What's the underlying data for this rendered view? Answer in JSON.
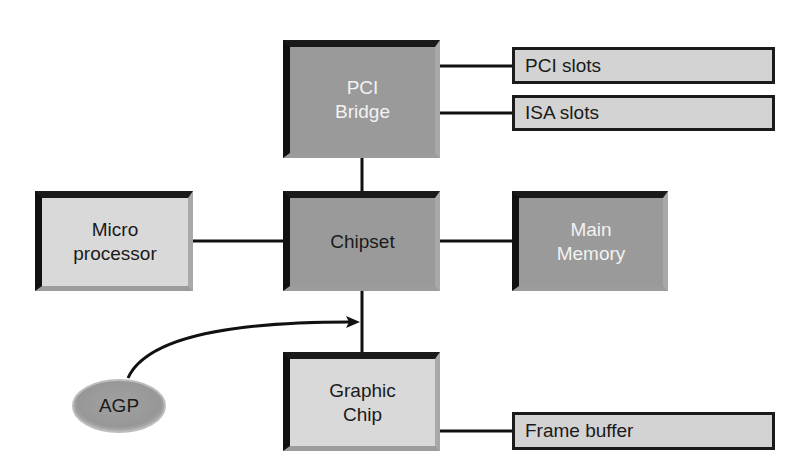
{
  "diagram": {
    "type": "block-diagram",
    "nodes": [
      {
        "id": "pci_bridge",
        "label_lines": [
          "PCI",
          "Bridge"
        ],
        "shape": "bevel-box",
        "fill": "#9a9a9a"
      },
      {
        "id": "pci_slots",
        "label": "PCI slots",
        "shape": "flat-box",
        "fill": "#d3d3d3"
      },
      {
        "id": "isa_slots",
        "label": "ISA slots",
        "shape": "flat-box",
        "fill": "#d3d3d3"
      },
      {
        "id": "micro_processor",
        "label_lines": [
          "Micro",
          "processor"
        ],
        "shape": "bevel-box",
        "fill": "#d9d9d9"
      },
      {
        "id": "chipset",
        "label": "Chipset",
        "shape": "bevel-box",
        "fill": "#9a9a9a"
      },
      {
        "id": "main_memory",
        "label_lines": [
          "Main",
          "Memory"
        ],
        "shape": "bevel-box",
        "fill": "#9a9a9a"
      },
      {
        "id": "graphic_chip",
        "label_lines": [
          "Graphic",
          "Chip"
        ],
        "shape": "bevel-box",
        "fill": "#d9d9d9"
      },
      {
        "id": "frame_buffer",
        "label": "Frame buffer",
        "shape": "flat-box",
        "fill": "#d3d3d3"
      },
      {
        "id": "agp",
        "label": "AGP",
        "shape": "ellipse",
        "fill": "#9a9a9a"
      }
    ],
    "edges": [
      {
        "from": "pci_bridge",
        "to": "pci_slots",
        "style": "line"
      },
      {
        "from": "pci_bridge",
        "to": "isa_slots",
        "style": "line"
      },
      {
        "from": "pci_bridge",
        "to": "chipset",
        "style": "line"
      },
      {
        "from": "micro_processor",
        "to": "chipset",
        "style": "line"
      },
      {
        "from": "chipset",
        "to": "main_memory",
        "style": "line"
      },
      {
        "from": "chipset",
        "to": "graphic_chip",
        "style": "line"
      },
      {
        "from": "graphic_chip",
        "to": "frame_buffer",
        "style": "line"
      },
      {
        "from": "agp",
        "to": "chipset-graphic_chip link",
        "style": "curved-arrow"
      }
    ]
  },
  "labels": {
    "pci_bridge": {
      "line1": "PCI",
      "line2": "Bridge"
    },
    "pci_slots": "PCI slots",
    "isa_slots": "ISA slots",
    "micro_processor": {
      "line1": "Micro",
      "line2": "processor"
    },
    "chipset": "Chipset",
    "main_memory": {
      "line1": "Main",
      "line2": "Memory"
    },
    "graphic_chip": {
      "line1": "Graphic",
      "line2": "Chip"
    },
    "frame_buffer": "Frame buffer",
    "agp": "AGP"
  },
  "colors": {
    "dark_fill": "#9a9a9a",
    "light_fill": "#d9d9d9",
    "slot_fill": "#d3d3d3",
    "line": "#111111",
    "background": "#ffffff"
  }
}
